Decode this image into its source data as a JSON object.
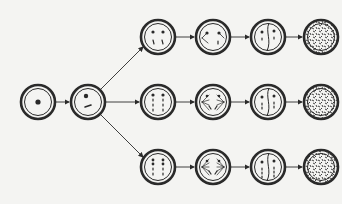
{
  "diagram": {
    "type": "cell-division-pathways",
    "colors": {
      "stroke": "#2a2a2a",
      "background": "#f4f4f2"
    },
    "start_cells": [
      {
        "id": "cell-initial",
        "cx": 38,
        "cy": 102
      },
      {
        "id": "cell-branch",
        "cx": 88,
        "cy": 102
      }
    ],
    "rows": [
      {
        "id": "top",
        "cy": 37,
        "columns": [
          158,
          213,
          268,
          321
        ]
      },
      {
        "id": "middle",
        "cy": 102,
        "columns": [
          158,
          213,
          268,
          321
        ]
      },
      {
        "id": "bottom",
        "cy": 167,
        "columns": [
          158,
          213,
          268,
          321
        ]
      }
    ],
    "stages": [
      "chromosomes",
      "spindle",
      "division",
      "dispersed"
    ]
  }
}
